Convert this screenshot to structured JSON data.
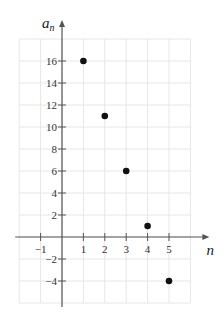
{
  "chart_data": {
    "type": "scatter",
    "title": "",
    "xlabel": "n",
    "ylabel": "a_n",
    "ylabel_main": "a",
    "ylabel_sub": "n",
    "xlim": [
      -2,
      6
    ],
    "ylim": [
      -6,
      18
    ],
    "grid": true,
    "x_grid_step": 1,
    "y_grid_step": 2,
    "x_ticks": [
      -1,
      1,
      2,
      3,
      4,
      5
    ],
    "x_tick_labels": [
      "−1",
      "1",
      "2",
      "3",
      "4",
      "5"
    ],
    "y_ticks": [
      -4,
      -2,
      2,
      4,
      6,
      8,
      10,
      12,
      14,
      16
    ],
    "y_tick_labels": [
      "−4",
      "−2",
      "2",
      "4",
      "6",
      "8",
      "10",
      "12",
      "14",
      "16"
    ],
    "series": [
      {
        "name": "a_n",
        "x": [
          1,
          2,
          3,
          4,
          5
        ],
        "y": [
          16,
          11,
          6,
          1,
          -4
        ]
      }
    ],
    "legend": null
  },
  "colors": {
    "grid": "#e6e6e6",
    "axis": "#555555",
    "point": "#111111",
    "text": "#333333"
  }
}
